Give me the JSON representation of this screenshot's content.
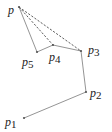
{
  "diagram": {
    "title": "",
    "points": [
      {
        "id": "p",
        "label": "p",
        "sub": "",
        "x": 19,
        "y": 7,
        "lx": 8,
        "ly": 14
      },
      {
        "id": "p1",
        "label": "p",
        "sub": "1",
        "x": 24,
        "y": 118,
        "lx": 5,
        "ly": 126
      },
      {
        "id": "p2",
        "label": "p",
        "sub": "2",
        "x": 86,
        "y": 92,
        "lx": 90,
        "ly": 97
      },
      {
        "id": "p3",
        "label": "p",
        "sub": "3",
        "x": 81,
        "y": 51,
        "lx": 88,
        "ly": 54
      },
      {
        "id": "p4",
        "label": "p",
        "sub": "4",
        "x": 53,
        "y": 45,
        "lx": 49,
        "ly": 61
      },
      {
        "id": "p5",
        "label": "p",
        "sub": "5",
        "x": 37,
        "y": 52,
        "lx": 22,
        "ly": 66
      }
    ],
    "solid_edges": [
      [
        "p1",
        "p2"
      ],
      [
        "p2",
        "p3"
      ],
      [
        "p3",
        "p4"
      ],
      [
        "p4",
        "p5"
      ],
      [
        "p5",
        "p"
      ]
    ],
    "dashed_edges": [
      [
        "p",
        "p3"
      ],
      [
        "p",
        "p4"
      ]
    ],
    "colors": {
      "solid": "#888888",
      "dashed": "#333333",
      "point": "#555555",
      "label": "#222222"
    }
  }
}
